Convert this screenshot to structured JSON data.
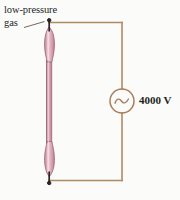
{
  "figure": {
    "type": "circuit-diagram",
    "background_color": "#fbfbfa",
    "annotations": {
      "gas_label": "low-pressure\ngas",
      "voltage_label": "4000 V"
    },
    "components": {
      "discharge_tube": {
        "name": "low-pressure gas discharge tube",
        "fill_color": "#d8a4b2",
        "highlight_color": "#eccfd6",
        "outline_color": "#9c5f70",
        "electrode_color": "#2b2326",
        "orientation": "vertical",
        "bulbs": 2
      },
      "ac_source": {
        "name": "ac-voltage-source",
        "symbol": "sine-wave-in-circle",
        "value": "4000 V",
        "stroke_color": "#a97e5c"
      },
      "wires": {
        "color": "#b08a63",
        "width_px": 1.6
      },
      "leader_line": {
        "color": "#4a4340",
        "from": "gas label",
        "to": "tube top"
      }
    }
  }
}
